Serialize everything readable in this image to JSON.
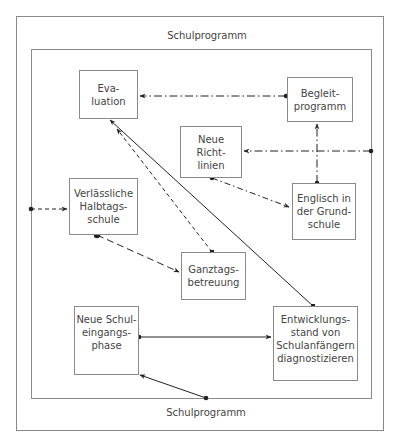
{
  "diagram": {
    "outer_frame": {
      "x": 16,
      "y": 16,
      "w": 368,
      "h": 415
    },
    "inner_frame": {
      "x": 31,
      "y": 49,
      "w": 341,
      "h": 350
    },
    "frame_labels": {
      "top": "Schulprogramm",
      "bottom": "Schulprogramm"
    },
    "nodes": {
      "evaluation": {
        "label": "Eva-\nluation",
        "x": 79,
        "y": 70,
        "w": 59,
        "h": 49
      },
      "begleitprogramm": {
        "label": "Begleit-\nprogramm",
        "x": 287,
        "y": 77,
        "w": 66,
        "h": 45
      },
      "neue_richtlinien": {
        "label": "Neue\nRicht-\nlinien",
        "x": 180,
        "y": 126,
        "w": 62,
        "h": 52
      },
      "englisch": {
        "label": "Englisch in\nder Grund-\nschule",
        "x": 292,
        "y": 183,
        "w": 64,
        "h": 57
      },
      "verlaessliche": {
        "label": "Verlässliche\nHalbtags-\nschule",
        "x": 69,
        "y": 178,
        "w": 69,
        "h": 57
      },
      "ganztags": {
        "label": "Ganztags-\nbetreuung",
        "x": 181,
        "y": 252,
        "w": 65,
        "h": 48
      },
      "neue_schuleingangsphase": {
        "label": "Neue Schul-\neingangs-\nphase",
        "x": 74,
        "y": 306,
        "w": 65,
        "h": 69
      },
      "entwicklungsstand": {
        "label": "Entwicklungs-\nstand von\nSchulanfängern\ndiagnostizieren",
        "x": 273,
        "y": 306,
        "w": 85,
        "h": 75
      }
    },
    "edges": [
      {
        "from": "begleitprogramm",
        "to": "evaluation",
        "style": "dash-dot",
        "start_marker": "dot",
        "end_marker": "arrow"
      },
      {
        "from": "inner_frame_right",
        "to": "neue_richtlinien",
        "style": "dash-dot",
        "start_marker": "dot",
        "end_marker": "arrow"
      },
      {
        "from": "englisch",
        "to": "begleitprogramm",
        "style": "dash-dot",
        "start_marker": "dot",
        "end_marker": "arrow"
      },
      {
        "from": "neue_richtlinien",
        "to": "englisch",
        "style": "dash-dot",
        "start_marker": "dot",
        "end_marker": "arrow"
      },
      {
        "from": "inner_frame_left",
        "to": "verlaessliche",
        "style": "dashed",
        "start_marker": "dot",
        "end_marker": "arrow"
      },
      {
        "from": "verlaessliche",
        "to": "ganztags",
        "style": "long-dashed",
        "start_marker": "dot",
        "end_marker": "arrow"
      },
      {
        "from": "ganztags",
        "to": "evaluation",
        "style": "dashed",
        "start_marker": "square",
        "end_marker": "arrow"
      },
      {
        "from": "entwicklungsstand",
        "to": "evaluation",
        "style": "solid",
        "start_marker": "square",
        "end_marker": "arrow"
      },
      {
        "from": "neue_schuleingangsphase",
        "to": "entwicklungsstand",
        "style": "solid",
        "start_marker": "dot",
        "end_marker": "arrow"
      },
      {
        "from": "inner_frame_bottom",
        "to": "neue_schuleingangsphase",
        "style": "solid",
        "start_marker": "dot",
        "end_marker": "arrow"
      }
    ],
    "colors": {
      "border": "#8a8a8a",
      "line": "#222222",
      "text": "#444444"
    }
  }
}
